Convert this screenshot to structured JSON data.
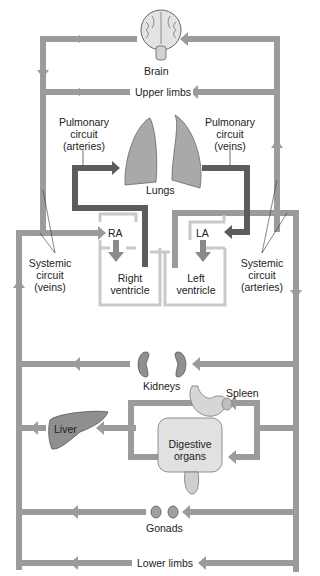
{
  "colors": {
    "systemic": "#9b9b9b",
    "pulmonary": "#5c5c5c",
    "heart_outline": "#c9c9c9",
    "organ_fill": "#8f8f8f",
    "background": "#ffffff"
  },
  "labels": {
    "brain": "Brain",
    "upper_limbs": "Upper limbs",
    "pulmonary_arteries": [
      "Pulmonary",
      "circuit",
      "(arteries)"
    ],
    "pulmonary_veins": [
      "Pulmonary",
      "circuit",
      "(veins)"
    ],
    "lungs": "Lungs",
    "ra": "RA",
    "la": "LA",
    "right_ventricle": [
      "Right",
      "ventricle"
    ],
    "left_ventricle": [
      "Left",
      "ventricle"
    ],
    "systemic_veins": [
      "Systemic",
      "circuit",
      "(veins)"
    ],
    "systemic_arteries": [
      "Systemic",
      "circuit",
      "(arteries)"
    ],
    "kidneys": "Kidneys",
    "spleen": "Spleen",
    "liver": "Liver",
    "digestive_organs": [
      "Digestive",
      "organs"
    ],
    "gonads": "Gonads",
    "lower_limbs": "Lower limbs"
  }
}
